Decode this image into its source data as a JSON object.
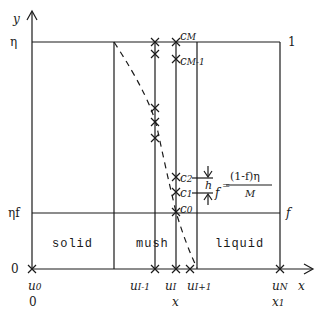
{
  "axes": {
    "y_label": "y",
    "x_label": "x",
    "y_ticks": {
      "top": "η",
      "mid": "ηf",
      "zero": "0"
    },
    "right_ticks": {
      "top": "1",
      "mid": "f"
    }
  },
  "regions": {
    "solid": "solid",
    "mush": "mush",
    "liquid": "liquid"
  },
  "x_nodes": {
    "u0": "u",
    "u0_sub": "0",
    "u0_below": "0",
    "uIm1": "u",
    "uIm1_sub": "I-1",
    "uI": "u",
    "uI_sub": "I",
    "uI_below": "x",
    "uIp1": "u",
    "uIp1_sub": "I+1",
    "uN": "u",
    "uN_sub": "N",
    "uN_below": "x",
    "uN_below_sub": "1"
  },
  "c_nodes": {
    "cM": "c",
    "cM_sub": "M",
    "cM1": "c",
    "cM1_sub": "M-1",
    "c2": "c",
    "c2_sub": "2",
    "c1": "c",
    "c1_sub": "1",
    "c0": "c",
    "c0_sub": "0"
  },
  "formula": {
    "h": "h",
    "lhs": "f",
    "numerator": "(1-f)η",
    "denominator": "M"
  },
  "colors": {
    "ink": "#1a1a1a",
    "background": "#ffffff"
  }
}
